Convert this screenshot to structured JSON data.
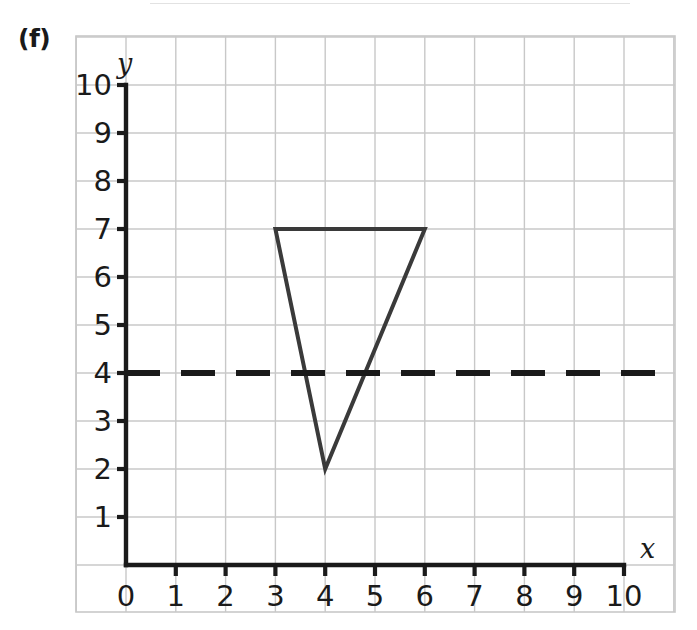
{
  "part_label": "(f)",
  "axes": {
    "x_name": "x",
    "y_name": "y",
    "x_ticks": [
      "0",
      "1",
      "2",
      "3",
      "4",
      "5",
      "6",
      "7",
      "8",
      "9",
      "10"
    ],
    "y_ticks": [
      "10",
      "9",
      "8",
      "7",
      "6",
      "5",
      "4",
      "3",
      "2",
      "1"
    ]
  },
  "colors": {
    "grid": "#c8c8c8",
    "axis": "#1a1a1a",
    "shape": "#3a3a3a",
    "mirror_line": "#1a1a1a",
    "background": "#ffffff"
  },
  "chart_data": {
    "type": "scatter",
    "title": "",
    "xlabel": "x",
    "ylabel": "y",
    "xlim": [
      0,
      10
    ],
    "ylim": [
      0,
      10
    ],
    "grid": true,
    "grid_step": 1,
    "legend": "none",
    "x": [
      3,
      6,
      4
    ],
    "y": [
      7,
      7,
      2
    ],
    "shapes": [
      {
        "name": "triangle",
        "kind": "polygon",
        "closed": true,
        "points": [
          [
            3,
            7
          ],
          [
            6,
            7
          ],
          [
            4,
            2
          ]
        ],
        "stroke": "#3a3a3a",
        "stroke_width": 4,
        "fill": "none"
      },
      {
        "name": "mirror-line",
        "kind": "line",
        "dashed": true,
        "equation": "y = 4",
        "points": [
          [
            0,
            4
          ],
          [
            11.0,
            4
          ]
        ],
        "stroke": "#1a1a1a",
        "stroke_width": 6
      }
    ],
    "annotations": []
  }
}
